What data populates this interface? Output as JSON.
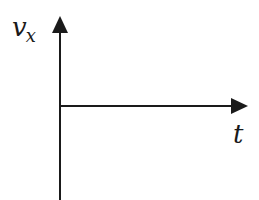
{
  "diagram": {
    "type": "velocity-time axes",
    "y_axis": {
      "label_main": "v",
      "label_sub": "x",
      "label_full": "v_x"
    },
    "x_axis": {
      "label": "t"
    },
    "colors": {
      "axis": "#1a1a1a",
      "background": "#ffffff"
    }
  }
}
